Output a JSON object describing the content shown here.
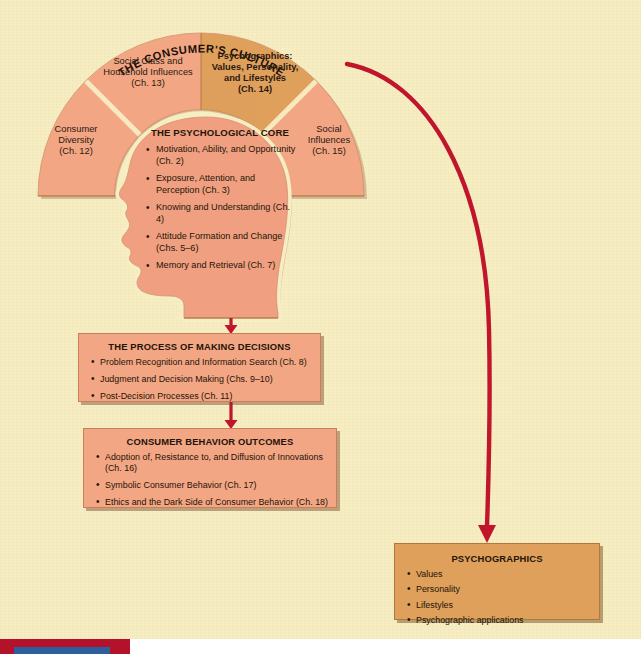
{
  "colors": {
    "background": "#f6edc2",
    "salmon": "#f3a684",
    "ochre": "#dfa05c",
    "arrow_red": "#c0152b",
    "head_fill": "#f0a080",
    "text": "#231408",
    "strip_red": "#b4122b",
    "strip_blue": "#2d5f9c"
  },
  "culture": {
    "title": "THE CONSUMER'S CULTURE",
    "wedges": [
      {
        "name": "consumer-diversity",
        "label": "Consumer\nDiversity\n(Ch. 12)",
        "highlight": false
      },
      {
        "name": "social-class",
        "label": "Social Class and\nHousehold Influences\n(Ch. 13)",
        "highlight": false
      },
      {
        "name": "psychographics",
        "label": "Psychographics:\nValues, Personality,\nand Lifestyles\n(Ch. 14)",
        "highlight": true
      },
      {
        "name": "social-influences",
        "label": "Social\nInfluences\n(Ch. 15)",
        "highlight": false
      }
    ]
  },
  "psych_core": {
    "title": "THE PSYCHOLOGICAL\nCORE",
    "items": [
      "Motivation, Ability, and Opportunity (Ch. 2)",
      "Exposure, Attention, and Perception (Ch. 3)",
      "Knowing and Understanding (Ch. 4)",
      "Attitude Formation and Change (Chs. 5–6)",
      "Memory and Retrieval (Ch. 7)"
    ]
  },
  "decisions": {
    "title": "THE PROCESS OF MAKING DECISIONS",
    "items": [
      "Problem Recognition and Information Search (Ch. 8)",
      "Judgment and Decision Making (Chs. 9–10)",
      "Post-Decision Processes (Ch. 11)"
    ]
  },
  "outcomes": {
    "title": "CONSUMER BEHAVIOR OUTCOMES",
    "items": [
      "Adoption of, Resistance to, and Diffusion of Innovations (Ch. 16)",
      "Symbolic Consumer Behavior (Ch. 17)",
      "Ethics and the Dark Side of Consumer Behavior (Ch. 18)"
    ]
  },
  "psychographics_box": {
    "title": "PSYCHOGRAPHICS",
    "items": [
      "Values",
      "Personality",
      "Lifestyles",
      "Psychographic applications"
    ]
  },
  "arrows": [
    {
      "name": "arrow-core-to-decisions",
      "direction": "down"
    },
    {
      "name": "arrow-decisions-to-outcomes",
      "direction": "down"
    },
    {
      "name": "arrow-psychographics-curve",
      "direction": "curved-down-right"
    }
  ]
}
